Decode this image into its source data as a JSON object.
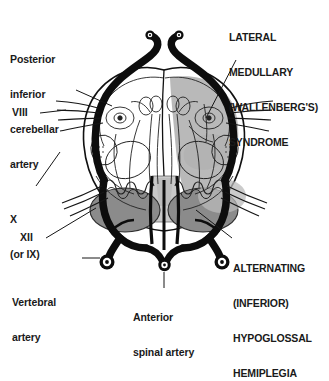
{
  "figure": {
    "background_color": "#ffffff",
    "ink_color": "#101010",
    "lesion_fill": "#b9b9b9",
    "pyramid_fill": "#8b8b8b",
    "median_fill": "#c9c9c9",
    "vessel_color": "#0d0d0d"
  },
  "labels": {
    "pica": {
      "lines": [
        "Posterior",
        "inferior",
        "cerebellar",
        "artery"
      ],
      "text": "Posterior inferior cerebellar artery"
    },
    "cn8": {
      "text": "VIII"
    },
    "cn10": {
      "lines": [
        "X",
        "(or IX)"
      ],
      "text": "X (or IX)"
    },
    "cn12": {
      "text": "XII"
    },
    "vertebral": {
      "lines": [
        "Vertebral",
        "artery"
      ],
      "text": "Vertebral artery"
    },
    "anterior_spinal": {
      "lines": [
        "Anterior",
        "spinal artery"
      ],
      "text": "Anterior spinal artery"
    },
    "wallenberg": {
      "lines": [
        "LATERAL",
        "MEDULLARY",
        "(WALLENBERG'S)",
        "SYNDROME"
      ],
      "text": "LATERAL MEDULLARY (WALLENBERG'S) SYNDROME"
    },
    "hypoglossal": {
      "lines": [
        "ALTERNATING",
        "(INFERIOR)",
        "HYPOGLOSSAL",
        "HEMIPLEGIA"
      ],
      "text": "ALTERNATING (INFERIOR) HYPOGLOSSAL HEMIPLEGIA"
    }
  },
  "structures": {
    "pyramid_left": "pyramid-left",
    "pyramid_right": "pyramid-right",
    "median_raphe": "median-raphe",
    "lesion_territory": "lateral-medullary-lesion",
    "vertebral_artery_left": "vertebral-artery-left",
    "vertebral_artery_right": "vertebral-artery-right",
    "anterior_spinal_artery": "anterior-spinal-artery",
    "pica_left": "pica-left",
    "pica_right": "pica-right"
  }
}
